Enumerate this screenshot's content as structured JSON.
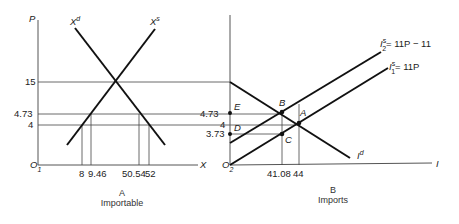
{
  "panel_a": {
    "caption_letter": "A",
    "caption_title": "Importable",
    "y_axis_label": "P",
    "x_axis_label": "X",
    "origin_label": "O",
    "origin_sub": "1",
    "demand_label": "X",
    "demand_sup": "d",
    "supply_label": "X",
    "supply_sup": "s",
    "y_ticks": [
      "15",
      "4.73",
      "4"
    ],
    "x_ticks": [
      "8",
      "9.46",
      "50.54",
      "52"
    ]
  },
  "panel_b": {
    "caption_letter": "B",
    "caption_title": "Imports",
    "x_axis_label": "I",
    "origin_label": "O",
    "origin_sub": "2",
    "demand_label": "I",
    "demand_sup": "d",
    "supply2_label": "I",
    "supply2_sup": "s",
    "supply2_sub": "2",
    "supply2_eq": "= 11P − 11",
    "supply1_label": "I",
    "supply1_sup": "s",
    "supply1_sub": "1",
    "supply1_eq": "= 11P",
    "y_ticks": [
      "4.73",
      "4",
      "3.73"
    ],
    "x_ticks": [
      "41.08",
      "44"
    ],
    "points": [
      "E",
      "D",
      "B",
      "A",
      "C"
    ]
  }
}
